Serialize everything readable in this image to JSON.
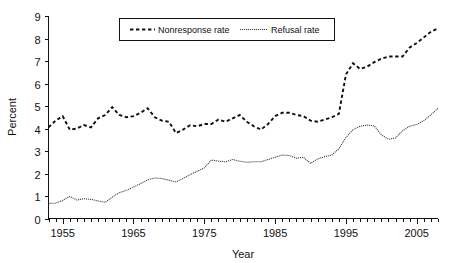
{
  "chart_data": {
    "type": "line",
    "title": "",
    "xlabel": "Year",
    "ylabel": "Percent",
    "xlim": [
      1953,
      2008
    ],
    "ylim": [
      0,
      9
    ],
    "grid": false,
    "legend_position": "top-center",
    "xticks_major": [
      1955,
      1965,
      1975,
      1985,
      1995,
      2005
    ],
    "xtick_labels": [
      "1955",
      "1965",
      "1975",
      "1985",
      "1995",
      "2005"
    ],
    "xtick_minor_step": 1,
    "yticks": [
      0,
      1,
      2,
      3,
      4,
      5,
      6,
      7,
      8,
      9
    ],
    "ytick_labels": [
      "0",
      "1",
      "2",
      "3",
      "4",
      "5",
      "6",
      "7",
      "8",
      "9"
    ],
    "x": [
      1953,
      1954,
      1955,
      1956,
      1957,
      1958,
      1959,
      1960,
      1961,
      1962,
      1963,
      1964,
      1965,
      1966,
      1967,
      1968,
      1969,
      1970,
      1971,
      1972,
      1973,
      1974,
      1975,
      1976,
      1977,
      1978,
      1979,
      1980,
      1981,
      1982,
      1983,
      1984,
      1985,
      1986,
      1987,
      1988,
      1989,
      1990,
      1991,
      1992,
      1993,
      1994,
      1995,
      1996,
      1997,
      1998,
      1999,
      2000,
      2001,
      2002,
      2003,
      2004,
      2005,
      2006,
      2007,
      2008
    ],
    "series": [
      {
        "name": "Nonresponse rate",
        "line_style": "dashed",
        "color": "#111111",
        "values": [
          4.05,
          4.35,
          4.55,
          3.95,
          4.0,
          4.15,
          4.05,
          4.45,
          4.6,
          4.95,
          4.6,
          4.5,
          4.55,
          4.7,
          4.9,
          4.5,
          4.35,
          4.3,
          3.8,
          3.95,
          4.15,
          4.1,
          4.2,
          4.2,
          4.4,
          4.3,
          4.45,
          4.6,
          4.3,
          4.1,
          3.95,
          4.2,
          4.55,
          4.7,
          4.7,
          4.6,
          4.55,
          4.35,
          4.3,
          4.4,
          4.5,
          4.65,
          6.4,
          6.9,
          6.65,
          6.75,
          6.95,
          7.1,
          7.2,
          7.2,
          7.2,
          7.6,
          7.8,
          8.05,
          8.3,
          8.45
        ]
      },
      {
        "name": "Refusal rate",
        "line_style": "dotted",
        "color": "#3a3a3a",
        "values": [
          0.67,
          0.68,
          0.8,
          0.98,
          0.82,
          0.88,
          0.85,
          0.78,
          0.72,
          0.95,
          1.15,
          1.25,
          1.4,
          1.55,
          1.72,
          1.8,
          1.78,
          1.7,
          1.62,
          1.78,
          1.95,
          2.1,
          2.25,
          2.6,
          2.55,
          2.52,
          2.62,
          2.55,
          2.5,
          2.52,
          2.52,
          2.62,
          2.72,
          2.82,
          2.8,
          2.68,
          2.72,
          2.45,
          2.65,
          2.75,
          2.82,
          3.1,
          3.6,
          3.95,
          4.1,
          4.15,
          4.12,
          3.72,
          3.52,
          3.58,
          3.9,
          4.1,
          4.18,
          4.35,
          4.6,
          4.9
        ]
      }
    ]
  },
  "legend": {
    "items": [
      {
        "label": "Nonresponse rate",
        "swatch": "dashed-line-swatch"
      },
      {
        "label": "Refusal rate",
        "swatch": "dotted-line-swatch"
      }
    ]
  },
  "axes": {
    "y_axis_title": "Percent",
    "x_axis_title": "Year"
  }
}
